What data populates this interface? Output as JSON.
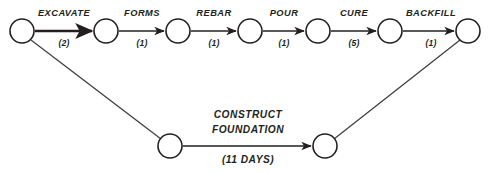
{
  "diagram": {
    "type": "activity-on-arrow-network",
    "title_visible": false,
    "colors": {
      "stroke": "#231f20",
      "diagonal_stroke": "#3a3a40",
      "node_fill": "#ffffff",
      "background": "#ffffff"
    },
    "nodes": [
      {
        "id": "n1",
        "cx": 22,
        "cy": 31,
        "r": 12
      },
      {
        "id": "n2",
        "cx": 106,
        "cy": 31,
        "r": 12
      },
      {
        "id": "n3",
        "cx": 178,
        "cy": 31,
        "r": 12
      },
      {
        "id": "n4",
        "cx": 250,
        "cy": 31,
        "r": 12
      },
      {
        "id": "n5",
        "cx": 318,
        "cy": 31,
        "r": 12
      },
      {
        "id": "n6",
        "cx": 390,
        "cy": 31,
        "r": 12
      },
      {
        "id": "n7",
        "cx": 468,
        "cy": 31,
        "r": 12
      },
      {
        "id": "n8",
        "cx": 170,
        "cy": 146,
        "r": 12
      },
      {
        "id": "n9",
        "cx": 325,
        "cy": 146,
        "r": 12
      }
    ],
    "activities": [
      {
        "name": "EXCAVATE",
        "duration": "(2)",
        "from": "n1",
        "to": "n2",
        "bold": true,
        "label_x": 64,
        "label_y": 16,
        "dur_x": 64,
        "dur_y": 46
      },
      {
        "name": "FORMS",
        "duration": "(1)",
        "from": "n2",
        "to": "n3",
        "bold": false,
        "label_x": 142,
        "label_y": 16,
        "dur_x": 142,
        "dur_y": 46
      },
      {
        "name": "REBAR",
        "duration": "(1)",
        "from": "n3",
        "to": "n4",
        "bold": false,
        "label_x": 214,
        "label_y": 16,
        "dur_x": 214,
        "dur_y": 46
      },
      {
        "name": "POUR",
        "duration": "(1)",
        "from": "n4",
        "to": "n5",
        "bold": false,
        "label_x": 284,
        "label_y": 16,
        "dur_x": 284,
        "dur_y": 46
      },
      {
        "name": "CURE",
        "duration": "(5)",
        "from": "n5",
        "to": "n6",
        "bold": false,
        "label_x": 354,
        "label_y": 16,
        "dur_x": 354,
        "dur_y": 46
      },
      {
        "name": "BACKFILL",
        "duration": "(1)",
        "from": "n6",
        "to": "n7",
        "bold": false,
        "label_x": 431,
        "label_y": 16,
        "dur_x": 431,
        "dur_y": 46
      }
    ],
    "summary_activity": {
      "name_line1": "CONSTRUCT",
      "name_line2": "FOUNDATION",
      "duration": "(11 DAYS)",
      "from": "n8",
      "to": "n9",
      "label_x": 248,
      "label_line1_y": 118,
      "label_line2_y": 133,
      "dur_x": 248,
      "dur_y": 163
    },
    "connector_lines": [
      {
        "id": "left-diagonal",
        "x1": 31,
        "y1": 40,
        "x2": 161,
        "y2": 139
      },
      {
        "id": "right-diagonal",
        "x1": 334,
        "y1": 139,
        "x2": 460,
        "y2": 40
      }
    ]
  }
}
